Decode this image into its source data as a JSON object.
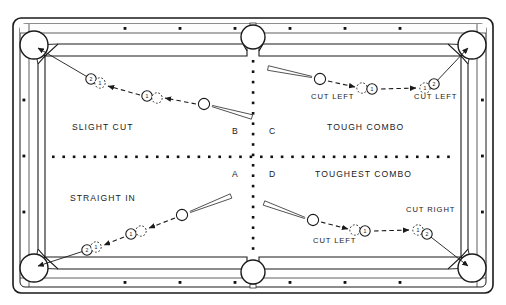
{
  "diagram": {
    "quadrant_letters": [
      "B",
      "C",
      "A",
      "D"
    ],
    "colors": {
      "ink": "#1a1a1a",
      "cloth": "#ffffff",
      "rail": "#ffffff",
      "dot": "#111111"
    }
  },
  "table": {
    "pockets": [
      {
        "name": "corner-pocket-top-left",
        "cx": 34,
        "cy": 45,
        "r": 14
      },
      {
        "name": "side-pocket-top",
        "cx": 253,
        "cy": 37,
        "r": 12
      },
      {
        "name": "corner-pocket-top-right",
        "cx": 472,
        "cy": 45,
        "r": 14
      },
      {
        "name": "corner-pocket-bottom-left",
        "cx": 34,
        "cy": 268,
        "r": 14
      },
      {
        "name": "side-pocket-bottom",
        "cx": 253,
        "cy": 272,
        "r": 12
      },
      {
        "name": "corner-pocket-bottom-right",
        "cx": 472,
        "cy": 268,
        "r": 14
      }
    ],
    "rail_diamonds_top": [
      125,
      180,
      235,
      290,
      345,
      400
    ],
    "rail_diamonds_bottom": [
      125,
      180,
      235,
      290,
      345,
      400
    ],
    "rail_diamonds_left": [
      100,
      156,
      212
    ],
    "rail_diamonds_right": [
      100,
      156,
      212
    ]
  },
  "quadrants": {
    "top_left": {
      "letter": "B",
      "title": "SLIGHT CUT",
      "title_x": 72,
      "title_y": 130,
      "letter_x": 232,
      "letter_y": 134,
      "cut_labels": []
    },
    "top_right": {
      "letter": "C",
      "title": "TOUGH COMBO",
      "title_x": 327,
      "title_y": 130,
      "letter_x": 269,
      "letter_y": 134,
      "cut_labels": [
        {
          "text": "CUT LEFT",
          "x": 311,
          "y": 99
        },
        {
          "text": "CUT LEFT",
          "x": 414,
          "y": 99
        }
      ]
    },
    "bottom_left": {
      "letter": "A",
      "title": "STRAIGHT IN",
      "title_x": 70,
      "title_y": 201,
      "letter_x": 232,
      "letter_y": 177,
      "cut_labels": []
    },
    "bottom_right": {
      "letter": "D",
      "title": "TOUGHEST COMBO",
      "title_x": 315,
      "title_y": 177,
      "letter_x": 269,
      "letter_y": 177,
      "cut_labels": [
        {
          "text": "CUT LEFT",
          "x": 313,
          "y": 243
        },
        {
          "text": "CUT RIGHT",
          "x": 406,
          "y": 212
        }
      ]
    }
  },
  "balls": {
    "top_left": [
      {
        "name": "object-ball-2",
        "cx": 91,
        "cy": 79,
        "r": 5.2,
        "style": "solid",
        "number": "2"
      },
      {
        "name": "ghost-ball-1",
        "cx": 100,
        "cy": 83,
        "r": 5.2,
        "style": "dashed",
        "number": "1"
      },
      {
        "name": "object-ball-1",
        "cx": 147,
        "cy": 96,
        "r": 5.2,
        "style": "solid",
        "number": "1"
      },
      {
        "name": "ghost-cue-position",
        "cx": 157,
        "cy": 98,
        "r": 5.2,
        "style": "dashed",
        "number": ""
      },
      {
        "name": "cue-ball",
        "cx": 204,
        "cy": 104,
        "r": 5.6,
        "style": "solid",
        "number": ""
      }
    ],
    "top_right": [
      {
        "name": "cue-ball",
        "cx": 320,
        "cy": 79,
        "r": 5.6,
        "style": "solid",
        "number": ""
      },
      {
        "name": "ghost-cue-position",
        "cx": 362,
        "cy": 88,
        "r": 5.2,
        "style": "dashed",
        "number": ""
      },
      {
        "name": "object-ball-1",
        "cx": 372,
        "cy": 89,
        "r": 5.2,
        "style": "solid",
        "number": "1"
      },
      {
        "name": "ghost-ball-1",
        "cx": 425,
        "cy": 88,
        "r": 5.2,
        "style": "dashed",
        "number": "1"
      },
      {
        "name": "object-ball-2",
        "cx": 434,
        "cy": 84,
        "r": 5.2,
        "style": "solid",
        "number": "2"
      }
    ],
    "bottom_left": [
      {
        "name": "object-ball-2",
        "cx": 87,
        "cy": 250,
        "r": 5.2,
        "style": "solid",
        "number": "2"
      },
      {
        "name": "ghost-ball-1",
        "cx": 96,
        "cy": 247,
        "r": 5.2,
        "style": "dashed",
        "number": "1"
      },
      {
        "name": "object-ball-1",
        "cx": 131,
        "cy": 234,
        "r": 5.2,
        "style": "solid",
        "number": "1"
      },
      {
        "name": "ghost-cue-position",
        "cx": 141,
        "cy": 231,
        "r": 5.2,
        "style": "dashed",
        "number": ""
      },
      {
        "name": "cue-ball",
        "cx": 182,
        "cy": 215,
        "r": 5.6,
        "style": "solid",
        "number": ""
      }
    ],
    "bottom_right": [
      {
        "name": "cue-ball",
        "cx": 313,
        "cy": 220,
        "r": 5.6,
        "style": "solid",
        "number": ""
      },
      {
        "name": "ghost-cue-position",
        "cx": 355,
        "cy": 230,
        "r": 5.2,
        "style": "dashed",
        "number": ""
      },
      {
        "name": "object-ball-1",
        "cx": 365,
        "cy": 231,
        "r": 5.2,
        "style": "solid",
        "number": "1"
      },
      {
        "name": "ghost-ball-1",
        "cx": 418,
        "cy": 230,
        "r": 5.2,
        "style": "dashed",
        "number": "1"
      },
      {
        "name": "object-ball-2",
        "cx": 427,
        "cy": 234,
        "r": 5.2,
        "style": "solid",
        "number": "2"
      }
    ]
  },
  "paths": {
    "top_left": {
      "pocket_line": "M 91,79 L 38,48",
      "dashed_segments": [
        {
          "from": [
            196,
            104
          ],
          "to": [
            165,
            98
          ]
        },
        {
          "from": [
            140,
            95
          ],
          "to": [
            108,
            86
          ]
        }
      ],
      "cue_stick": {
        "x1": 212,
        "y1": 106,
        "x2": 252,
        "y2": 117
      }
    },
    "top_right": {
      "pocket_line": "M 434,84 L 468,48",
      "dashed_segments": [
        {
          "from": [
            328,
            81
          ],
          "to": [
            355,
            87
          ]
        },
        {
          "from": [
            381,
            89
          ],
          "to": [
            416,
            88
          ]
        }
      ],
      "cue_stick": {
        "x1": 312,
        "y1": 77,
        "x2": 268,
        "y2": 68
      }
    },
    "bottom_left": {
      "pocket_line": "M 87,250 L 38,266",
      "dashed_segments": [
        {
          "from": [
            175,
            218
          ],
          "to": [
            149,
            228
          ]
        },
        {
          "from": [
            124,
            237
          ],
          "to": [
            104,
            245
          ]
        }
      ],
      "cue_stick": {
        "x1": 190,
        "y1": 212,
        "x2": 231,
        "y2": 196
      }
    },
    "bottom_right": {
      "pocket_line": "M 427,234 L 468,266",
      "dashed_segments": [
        {
          "from": [
            321,
            222
          ],
          "to": [
            348,
            229
          ]
        },
        {
          "from": [
            374,
            231
          ],
          "to": [
            409,
            230
          ]
        }
      ],
      "cue_stick": {
        "x1": 305,
        "y1": 218,
        "x2": 264,
        "y2": 203
      }
    }
  }
}
